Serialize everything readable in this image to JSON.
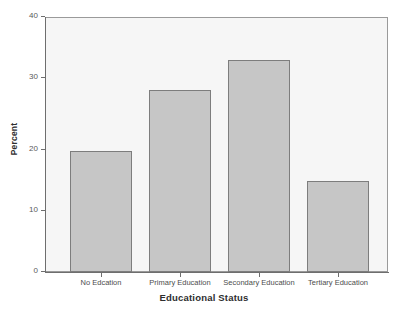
{
  "chart_data": {
    "type": "bar",
    "title": "",
    "subtitle": "",
    "xlabel": "Educational Status",
    "ylabel": "Percent",
    "categories": [
      "No Edcation",
      "Primary Education",
      "Secondary Education",
      "Tertiary Education"
    ],
    "values": [
      20,
      30,
      35,
      15
    ],
    "series": [
      {
        "name": "Percent",
        "values": [
          20,
          30,
          35,
          15
        ]
      }
    ],
    "ylim": [
      0,
      42
    ],
    "yticks": [
      0,
      10,
      20,
      30,
      40
    ],
    "ytick_labels": [
      "0",
      "10",
      "20",
      "30",
      "40"
    ],
    "xlim_categories": 4,
    "grid": false,
    "legend": false,
    "legend_position": "none",
    "bar_fill_color": "#c6c6c6",
    "bar_border_color": "#7d7d7d",
    "plot_background_color": "#f6f6f6",
    "page_background_color": "#ffffff",
    "axis_color": "#6e6e6e",
    "annotations": []
  },
  "axes": {
    "x_title": "Educational Status",
    "y_title": "Percent"
  },
  "ticks": {
    "y": [
      {
        "label": "40",
        "value": 40
      },
      {
        "label": "30",
        "value": 30
      },
      {
        "label": "20",
        "value": 20
      },
      {
        "label": "10",
        "value": 10
      },
      {
        "label": "0",
        "value": 0
      }
    ],
    "x": [
      {
        "label": "No Edcation"
      },
      {
        "label": "Primary Education"
      },
      {
        "label": "Secondary Education"
      },
      {
        "label": "Tertiary Education"
      }
    ]
  }
}
